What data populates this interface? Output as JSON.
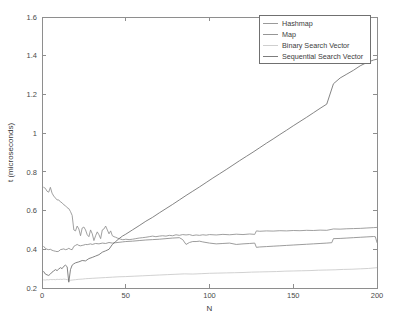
{
  "chart_data": {
    "type": "line",
    "title": "",
    "xlabel": "N",
    "ylabel": "t (microseconds)",
    "xlim": [
      0,
      200
    ],
    "ylim": [
      0.2,
      1.6
    ],
    "xticks": [
      0,
      50,
      100,
      150,
      200
    ],
    "yticks": [
      0.2,
      0.4,
      0.6,
      0.8,
      1,
      1.2,
      1.4,
      1.6
    ],
    "xtick_labels": [
      "0",
      "50",
      "100",
      "150",
      "200"
    ],
    "ytick_labels": [
      "0.2",
      "0.4",
      "0.6",
      "0.8",
      "1",
      "1.2",
      "1.4",
      "1.6"
    ],
    "grid": false,
    "legend_position": "top-right",
    "series": [
      {
        "name": "Hashmap",
        "color": "#8f8f8f",
        "x": [
          1,
          2,
          3,
          4,
          5,
          6,
          7,
          8,
          9,
          10,
          11,
          12,
          13,
          14,
          15,
          16,
          17,
          18,
          19,
          20,
          21,
          22,
          23,
          24,
          25,
          26,
          27,
          28,
          29,
          30,
          31,
          32,
          33,
          34,
          35,
          36,
          37,
          38,
          39,
          40,
          41,
          42,
          43,
          44,
          45,
          46,
          47,
          48,
          49,
          50,
          52,
          54,
          56,
          58,
          60,
          62,
          64,
          66,
          68,
          70,
          72,
          74,
          76,
          78,
          80,
          82,
          84,
          86,
          88,
          90,
          92,
          94,
          96,
          98,
          100,
          104,
          108,
          112,
          116,
          120,
          124,
          127,
          128,
          130,
          134,
          138,
          142,
          146,
          150,
          154,
          158,
          162,
          166,
          170,
          174,
          178,
          182,
          186,
          190,
          194,
          198,
          200
        ],
        "y": [
          0.72,
          0.715,
          0.7,
          0.695,
          0.72,
          0.69,
          0.675,
          0.665,
          0.655,
          0.655,
          0.645,
          0.64,
          0.63,
          0.625,
          0.615,
          0.61,
          0.595,
          0.575,
          0.5,
          0.495,
          0.52,
          0.505,
          0.47,
          0.51,
          0.515,
          0.5,
          0.475,
          0.465,
          0.5,
          0.48,
          0.445,
          0.47,
          0.49,
          0.475,
          0.455,
          0.5,
          0.505,
          0.52,
          0.5,
          0.48,
          0.495,
          0.47,
          0.465,
          0.462,
          0.458,
          0.455,
          0.452,
          0.45,
          0.45,
          0.452,
          0.45,
          0.452,
          0.455,
          0.458,
          0.46,
          0.462,
          0.465,
          0.468,
          0.465,
          0.468,
          0.47,
          0.468,
          0.472,
          0.47,
          0.475,
          0.472,
          0.476,
          0.474,
          0.476,
          0.471,
          0.474,
          0.472,
          0.475,
          0.473,
          0.476,
          0.474,
          0.477,
          0.475,
          0.478,
          0.476,
          0.479,
          0.477,
          0.495,
          0.493,
          0.495,
          0.494,
          0.496,
          0.495,
          0.497,
          0.496,
          0.498,
          0.497,
          0.499,
          0.498,
          0.505,
          0.504,
          0.506,
          0.507,
          0.508,
          0.51,
          0.512,
          0.513
        ]
      },
      {
        "name": "Map",
        "color": "#8a8a8a",
        "x": [
          1,
          2,
          3,
          4,
          5,
          6,
          7,
          8,
          9,
          10,
          11,
          12,
          13,
          14,
          15,
          16,
          17,
          18,
          19,
          20,
          21,
          22,
          23,
          24,
          25,
          26,
          27,
          28,
          29,
          30,
          32,
          34,
          36,
          38,
          40,
          42,
          44,
          46,
          48,
          50,
          54,
          58,
          62,
          66,
          70,
          74,
          78,
          82,
          84,
          86,
          88,
          90,
          92,
          94,
          96,
          100,
          104,
          108,
          112,
          116,
          120,
          124,
          127,
          128,
          130,
          134,
          138,
          142,
          146,
          150,
          154,
          158,
          162,
          166,
          170,
          173,
          174,
          178,
          182,
          186,
          190,
          194,
          198,
          199,
          200
        ],
        "y": [
          0.415,
          0.405,
          0.4,
          0.398,
          0.4,
          0.395,
          0.392,
          0.39,
          0.388,
          0.39,
          0.398,
          0.4,
          0.402,
          0.398,
          0.4,
          0.405,
          0.4,
          0.398,
          0.415,
          0.42,
          0.425,
          0.42,
          0.418,
          0.42,
          0.422,
          0.425,
          0.424,
          0.426,
          0.428,
          0.425,
          0.43,
          0.428,
          0.432,
          0.43,
          0.435,
          0.432,
          0.434,
          0.436,
          0.438,
          0.44,
          0.442,
          0.445,
          0.448,
          0.45,
          0.452,
          0.455,
          0.458,
          0.46,
          0.45,
          0.425,
          0.435,
          0.44,
          0.44,
          0.442,
          0.438,
          0.432,
          0.428,
          0.43,
          0.432,
          0.425,
          0.428,
          0.43,
          0.432,
          0.41,
          0.412,
          0.414,
          0.416,
          0.418,
          0.42,
          0.422,
          0.424,
          0.426,
          0.428,
          0.43,
          0.432,
          0.434,
          0.455,
          0.456,
          0.458,
          0.46,
          0.462,
          0.464,
          0.466,
          0.465,
          0.435
        ]
      },
      {
        "name": "Binary Search Vector",
        "color": "#c9c9c9",
        "x": [
          1,
          2,
          3,
          4,
          5,
          6,
          7,
          8,
          9,
          10,
          11,
          12,
          13,
          14,
          15,
          16,
          17,
          18,
          20,
          22,
          24,
          26,
          28,
          30,
          34,
          38,
          42,
          46,
          50,
          55,
          60,
          65,
          70,
          75,
          80,
          85,
          90,
          95,
          100,
          105,
          110,
          115,
          120,
          125,
          130,
          135,
          140,
          145,
          150,
          155,
          160,
          165,
          170,
          175,
          180,
          185,
          190,
          195,
          200
        ],
        "y": [
          0.242,
          0.241,
          0.243,
          0.242,
          0.244,
          0.243,
          0.244,
          0.243,
          0.245,
          0.244,
          0.245,
          0.244,
          0.246,
          0.245,
          0.243,
          0.241,
          0.24,
          0.241,
          0.243,
          0.245,
          0.246,
          0.248,
          0.249,
          0.25,
          0.252,
          0.254,
          0.256,
          0.258,
          0.259,
          0.261,
          0.263,
          0.265,
          0.267,
          0.269,
          0.271,
          0.273,
          0.272,
          0.274,
          0.276,
          0.277,
          0.278,
          0.279,
          0.28,
          0.282,
          0.283,
          0.284,
          0.285,
          0.287,
          0.288,
          0.289,
          0.29,
          0.292,
          0.293,
          0.294,
          0.296,
          0.297,
          0.299,
          0.301,
          0.305
        ]
      },
      {
        "name": "Sequential Search Vector",
        "color": "#6e6e6e",
        "x": [
          1,
          2,
          3,
          4,
          5,
          6,
          7,
          8,
          9,
          10,
          11,
          12,
          13,
          14,
          15,
          16,
          17,
          18,
          19,
          20,
          22,
          24,
          26,
          28,
          30,
          32,
          34,
          36,
          38,
          40,
          42,
          44,
          46,
          48,
          50,
          54,
          58,
          62,
          66,
          70,
          74,
          78,
          82,
          86,
          90,
          94,
          98,
          102,
          106,
          110,
          114,
          118,
          122,
          126,
          130,
          134,
          138,
          142,
          146,
          150,
          154,
          158,
          162,
          166,
          170,
          174,
          178,
          182,
          186,
          190,
          194,
          198,
          200
        ],
        "y": [
          0.285,
          0.272,
          0.268,
          0.265,
          0.272,
          0.282,
          0.288,
          0.295,
          0.29,
          0.298,
          0.305,
          0.3,
          0.312,
          0.318,
          0.31,
          0.23,
          0.295,
          0.318,
          0.325,
          0.33,
          0.335,
          0.342,
          0.34,
          0.352,
          0.358,
          0.365,
          0.372,
          0.385,
          0.392,
          0.4,
          0.425,
          0.44,
          0.455,
          0.468,
          0.478,
          0.5,
          0.522,
          0.545,
          0.565,
          0.588,
          0.61,
          0.632,
          0.655,
          0.678,
          0.7,
          0.722,
          0.745,
          0.768,
          0.79,
          0.812,
          0.835,
          0.858,
          0.88,
          0.902,
          0.925,
          0.948,
          0.97,
          0.993,
          1.015,
          1.038,
          1.06,
          1.082,
          1.105,
          1.128,
          1.15,
          1.255,
          1.285,
          1.305,
          1.325,
          1.348,
          1.365,
          1.378,
          1.382
        ]
      }
    ]
  },
  "axes": {
    "xlabel": "N",
    "ylabel": "t (microseconds)"
  },
  "legend": {
    "entries": [
      {
        "label": "Hashmap"
      },
      {
        "label": "Map"
      },
      {
        "label": "Binary Search Vector"
      },
      {
        "label": "Sequential Search Vector"
      }
    ]
  }
}
